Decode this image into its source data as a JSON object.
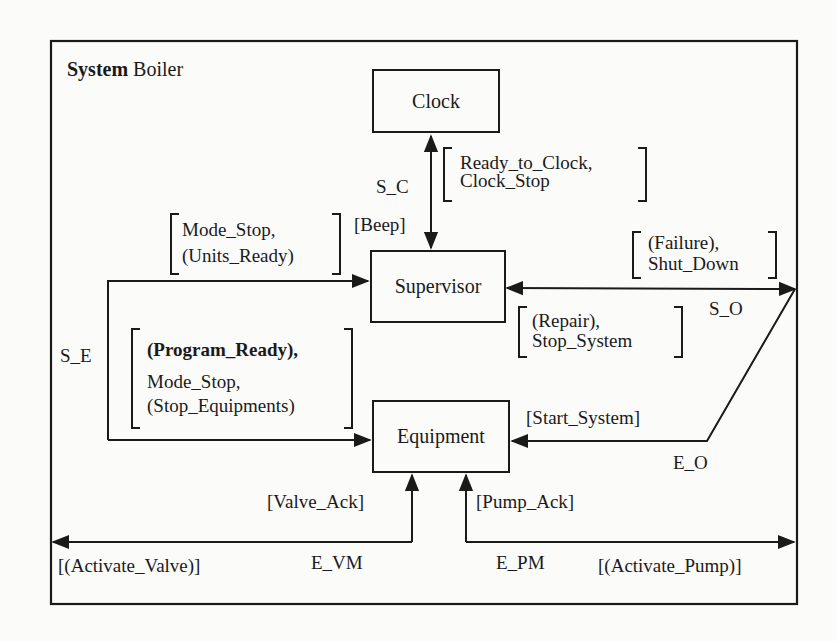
{
  "title": {
    "keyword": "System",
    "name": "Boiler"
  },
  "components": {
    "clock": "Clock",
    "supervisor": "Supervisor",
    "equipment": "Equipment"
  },
  "channels": {
    "s_c": "S_C",
    "s_e": "S_E",
    "s_o": "S_O",
    "e_o": "E_O",
    "e_vm": "E_VM",
    "e_pm": "E_PM"
  },
  "messages": {
    "clock_in": [
      "Ready_to_Clock,",
      "Clock_Stop"
    ],
    "beep": "[Beep]",
    "supervisor_in_left": [
      "Mode_Stop,",
      "(Units_Ready)"
    ],
    "equipment_in_left": [
      "(Program_Ready),",
      "Mode_Stop,",
      "(Stop_Equipments)"
    ],
    "supervisor_out_right": [
      "(Failure),",
      "Shut_Down"
    ],
    "supervisor_in_right": [
      "(Repair),",
      "Stop_System"
    ],
    "start_system": "[Start_System]",
    "valve_ack": "[Valve_Ack]",
    "pump_ack": "[Pump_Ack]",
    "activate_valve": "[(Activate_Valve)]",
    "activate_pump": "[(Activate_Pump)]"
  },
  "colors": {
    "ink": "#1a1a1a",
    "paper": "#fbfbfa"
  }
}
